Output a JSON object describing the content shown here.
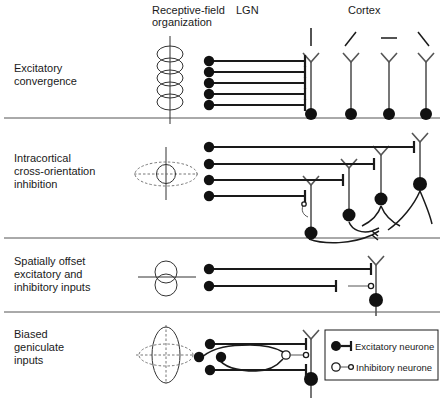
{
  "figure": {
    "width": 444,
    "height": 406
  },
  "headers": {
    "receptive_field": "Receptive-field\norganization",
    "receptive_field_line1": "Receptive-field",
    "receptive_field_line2": "organization",
    "lgn": "LGN",
    "cortex": "Cortex"
  },
  "rows": [
    {
      "id": "excitatory-convergence",
      "label_line1": "Excitatory",
      "label_line2": "convergence",
      "label_line3": "",
      "rf_icon": "vertical-chain-of-circles",
      "lgn_input_count": 5,
      "cortical_neuron_count": 4,
      "orientation_bars": [
        "vertical",
        "diagonal-right",
        "horizontal",
        "diagonal-left"
      ]
    },
    {
      "id": "intracortical-cross-orientation-inhibition",
      "label_line1": "Intracortical",
      "label_line2": "cross-orientation",
      "label_line3": "inhibition",
      "rf_icon": "horizontal-ellipse-with-center-circle",
      "lgn_input_count": 4,
      "cortical_neuron_count": 4,
      "orientation_bars": []
    },
    {
      "id": "spatially-offset-excitatory-and-inhibitory-inputs",
      "label_line1": "Spatially offset",
      "label_line2": "excitatory and",
      "label_line3": "inhibitory inputs",
      "rf_icon": "two-stacked-circles-with-horizontal-line",
      "lgn_input_count": 2,
      "cortical_neuron_count": 1,
      "orientation_bars": []
    },
    {
      "id": "biased-geniculate-inputs",
      "label_line1": "Biased",
      "label_line2": "geniculate",
      "label_line3": "inputs",
      "rf_icon": "vertical-ellipse-crossed-horizontal-ellipse",
      "lgn_input_count": 4,
      "cortical_neuron_count": 1,
      "orientation_bars": []
    }
  ],
  "legend": {
    "items": [
      {
        "symbol": "filled-circle-with-bar-terminal",
        "label": "Excitatory neurone"
      },
      {
        "symbol": "open-circle-with-open-terminal",
        "label": "Inhibitory neurone"
      }
    ]
  },
  "colors": {
    "ink": "#1a1a1a",
    "mid": "#555555",
    "background": "#ffffff"
  }
}
